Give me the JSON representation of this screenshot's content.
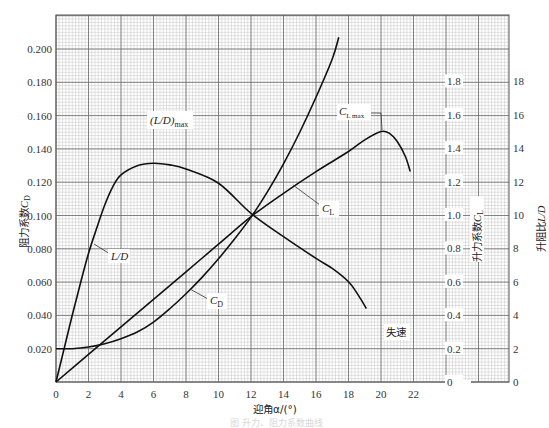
{
  "chart_data": {
    "type": "line",
    "title": "",
    "xlabel": "迎角α/(°)",
    "x_ticks": [
      "0",
      "2",
      "4",
      "6",
      "8",
      "10",
      "12",
      "14",
      "16",
      "18",
      "20",
      "22"
    ],
    "xlim": [
      0,
      27.9
    ],
    "axes": {
      "left": {
        "label": "阻力系数C_D",
        "ticks": [
          "0.020",
          "0.040",
          "0.060",
          "0.080",
          "0.100",
          "0.120",
          "0.140",
          "0.160",
          "0.180",
          "0.200"
        ],
        "lim": [
          0,
          0.22
        ]
      },
      "right_inner": {
        "label": "升力系数C_L",
        "ticks": [
          "0",
          "0.2",
          "0.4",
          "0.6",
          "0.8",
          "1.0",
          "1.2",
          "1.4",
          "1.6",
          "1.8"
        ],
        "lim": [
          0,
          2.2
        ]
      },
      "right_outer": {
        "label": "升阻比L/D",
        "ticks": [
          "0",
          "2",
          "4",
          "6",
          "8",
          "10",
          "12",
          "14",
          "16",
          "18"
        ],
        "lim": [
          0,
          22
        ]
      }
    },
    "grid": true,
    "series": [
      {
        "name": "C_D",
        "axis": "left",
        "x": [
          0,
          1,
          2,
          3,
          4,
          5,
          6,
          7,
          8,
          9,
          10,
          11,
          12,
          13,
          14,
          15,
          16,
          17,
          17.4
        ],
        "values": [
          0.02,
          0.02,
          0.021,
          0.023,
          0.026,
          0.03,
          0.036,
          0.044,
          0.053,
          0.063,
          0.074,
          0.086,
          0.099,
          0.114,
          0.131,
          0.15,
          0.171,
          0.194,
          0.207
        ]
      },
      {
        "name": "C_L",
        "axis": "right_inner",
        "x": [
          0,
          2,
          4,
          6,
          8,
          10,
          12,
          14,
          16,
          18,
          19,
          20,
          20.5,
          21,
          21.5,
          21.8
        ],
        "values": [
          0.0,
          0.165,
          0.33,
          0.495,
          0.66,
          0.825,
          0.99,
          1.13,
          1.26,
          1.38,
          1.45,
          1.5,
          1.49,
          1.44,
          1.35,
          1.26
        ]
      },
      {
        "name": "L/D",
        "axis": "right_outer",
        "x": [
          0,
          0.5,
          1,
          1.5,
          2,
          2.5,
          3,
          3.5,
          4,
          5,
          6,
          7,
          8,
          10,
          12,
          14,
          16,
          17,
          18,
          18.6,
          19.1
        ],
        "values": [
          0,
          2.0,
          4.0,
          5.9,
          7.7,
          9.2,
          10.6,
          11.7,
          12.4,
          12.95,
          13.1,
          13.0,
          12.75,
          11.9,
          10.1,
          8.7,
          7.4,
          6.8,
          6.0,
          5.2,
          4.4
        ]
      }
    ],
    "annotations": [
      {
        "text": "(L/D)max",
        "near": "L/D peak, α≈6"
      },
      {
        "text": "L/D",
        "near": "L/D rising branch, α≈2.2"
      },
      {
        "text": "C_D",
        "near": "C_D curve, α≈9"
      },
      {
        "text": "C_L",
        "near": "C_L curve, α≈14"
      },
      {
        "text": "C_L max",
        "near": "C_L peak, α≈20"
      },
      {
        "text": "失速",
        "near": "α≈20, bottom region"
      }
    ]
  },
  "labels": {
    "x_axis_title": "迎角α/(°)",
    "left_axis_title_main": "阻力系数",
    "left_axis_title_sym": "C",
    "left_axis_title_sub": "D",
    "right_inner_title_main": "升力系数",
    "right_inner_title_sym": "C",
    "right_inner_title_sub": "L",
    "right_outer_title_main": "升阻比",
    "right_outer_title_sym": "L/D",
    "ld_max_main": "(L/D)",
    "ld_max_sub": "max",
    "ld_label": "L/D",
    "cd_label_main": "C",
    "cd_label_sub": "D",
    "cl_label_main": "C",
    "cl_label_sub": "L",
    "clmax_main": "C",
    "clmax_sub": "L max",
    "stall": "失速",
    "caption": "图 升力、阻力系数曲线"
  }
}
